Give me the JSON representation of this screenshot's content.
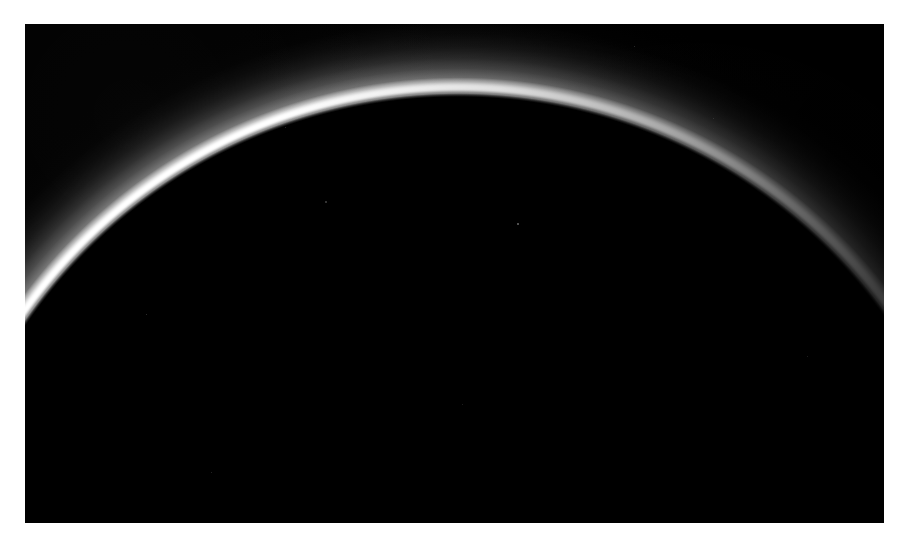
{
  "page": {
    "background_color": "#ffffff",
    "width": 906,
    "height": 550
  },
  "photo": {
    "alt_text": "Backlit crescent limb of Pluto showing layered atmospheric haze against black space",
    "frame": {
      "x": 25,
      "y": 24,
      "width": 859,
      "height": 499
    },
    "background_color": "#000000",
    "highlight_color": "#ffffff",
    "haze_color": "#c8c8c8",
    "caption": ""
  },
  "scene": {
    "body_limb": {
      "center_x": 433,
      "center_y": 596,
      "radius": 523,
      "rim_color": "#ffffff",
      "rim_peak_brightness": 1.0
    },
    "haze_layers": [
      {
        "name": "bright-inner-rim",
        "offset_px": 0,
        "thickness_px": 7,
        "opacity": 1.0
      },
      {
        "name": "primary-haze",
        "offset_px": 10,
        "thickness_px": 34,
        "opacity": 0.45
      },
      {
        "name": "detached-haze-band",
        "offset_px": 40,
        "thickness_px": 42,
        "opacity": 0.12
      }
    ],
    "illumination": {
      "direction_deg": 128,
      "brightest_quadrant": "upper-left",
      "dimmest_quadrant": "lower-right"
    },
    "specks": [
      {
        "x": 517,
        "y": 223,
        "size": 2.0,
        "opacity": 0.55
      },
      {
        "x": 325,
        "y": 201,
        "size": 1.6,
        "opacity": 0.33
      },
      {
        "x": 634,
        "y": 46,
        "size": 1.4,
        "opacity": 0.28
      },
      {
        "x": 146,
        "y": 314,
        "size": 1.4,
        "opacity": 0.3
      },
      {
        "x": 285,
        "y": 127,
        "size": 1.3,
        "opacity": 0.26
      },
      {
        "x": 211,
        "y": 472,
        "size": 1.3,
        "opacity": 0.24
      },
      {
        "x": 713,
        "y": 118,
        "size": 1.2,
        "opacity": 0.22
      },
      {
        "x": 462,
        "y": 404,
        "size": 1.2,
        "opacity": 0.2
      },
      {
        "x": 807,
        "y": 356,
        "size": 1.2,
        "opacity": 0.2
      }
    ]
  }
}
